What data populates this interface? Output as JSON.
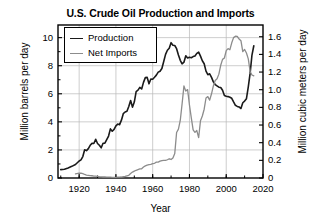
{
  "chart_data": {
    "type": "line",
    "title": "U.S. Crude Oil Production and Imports",
    "xlabel": "Year",
    "ylabel": "Million barrels per day",
    "ylabel_right": "Million cubic meters per day",
    "xlim": [
      1908.5,
      2020
    ],
    "ylim": [
      0,
      10.9
    ],
    "ylim_right": [
      0,
      1.733
    ],
    "grid": true,
    "legend_position": "upper-left",
    "xticks": [
      1920,
      1940,
      1960,
      1980,
      2000,
      2020
    ],
    "xtick_labels": [
      "1920",
      "1940",
      "1960",
      "1980",
      "2000",
      "2020"
    ],
    "yticks": [
      0,
      2,
      4,
      6,
      8,
      10
    ],
    "ytick_labels": [
      "0",
      "2",
      "4",
      "6",
      "8",
      "10"
    ],
    "yticks_right": [
      0,
      0.2,
      0.4,
      0.6,
      0.8,
      1.0,
      1.2,
      1.4,
      1.6
    ],
    "ytick_labels_right": [
      "0",
      "0.2",
      "0.4",
      "0.6",
      "0.8",
      "1.0",
      "1.2",
      "1.4",
      "1.6"
    ],
    "colors": {
      "production": "#1a1a1a",
      "net_imports": "#8c8c8c"
    },
    "series": [
      {
        "name": "Production",
        "color": "#1a1a1a",
        "width": 1.6,
        "x": [
          1910,
          1912,
          1914,
          1916,
          1918,
          1920,
          1921,
          1922,
          1923,
          1924,
          1925,
          1926,
          1927,
          1928,
          1929,
          1930,
          1931,
          1932,
          1933,
          1934,
          1935,
          1936,
          1937,
          1938,
          1939,
          1940,
          1941,
          1942,
          1943,
          1944,
          1945,
          1946,
          1947,
          1948,
          1949,
          1950,
          1951,
          1952,
          1953,
          1954,
          1955,
          1956,
          1957,
          1958,
          1959,
          1960,
          1961,
          1962,
          1963,
          1964,
          1965,
          1966,
          1967,
          1968,
          1969,
          1970,
          1971,
          1972,
          1973,
          1974,
          1975,
          1976,
          1977,
          1978,
          1979,
          1980,
          1981,
          1982,
          1983,
          1984,
          1985,
          1986,
          1987,
          1988,
          1989,
          1990,
          1991,
          1992,
          1993,
          1994,
          1995,
          1996,
          1997,
          1998,
          1999,
          2000,
          2001,
          2002,
          2003,
          2004,
          2005,
          2006,
          2007,
          2008,
          2009,
          2010,
          2011,
          2012,
          2013,
          2014,
          2015
        ],
        "y": [
          0.6,
          0.62,
          0.72,
          0.83,
          0.96,
          1.21,
          1.29,
          1.53,
          2.01,
          1.95,
          2.09,
          2.33,
          2.47,
          2.46,
          2.76,
          2.46,
          2.33,
          2.15,
          2.48,
          2.48,
          2.73,
          2.99,
          3.5,
          3.33,
          3.46,
          3.71,
          3.84,
          3.8,
          4.12,
          4.58,
          4.7,
          4.75,
          5.09,
          5.52,
          5.05,
          5.41,
          6.16,
          6.26,
          6.46,
          6.34,
          6.81,
          7.15,
          7.17,
          6.71,
          7.05,
          7.04,
          7.18,
          7.33,
          7.54,
          7.61,
          7.8,
          8.3,
          8.81,
          9.1,
          9.24,
          9.64,
          9.46,
          9.44,
          9.21,
          8.77,
          8.38,
          8.13,
          8.25,
          8.71,
          8.55,
          8.6,
          8.57,
          8.65,
          8.69,
          8.88,
          8.97,
          8.68,
          8.35,
          8.14,
          7.61,
          7.36,
          7.42,
          7.17,
          6.85,
          6.66,
          6.56,
          6.47,
          6.45,
          6.25,
          5.88,
          5.82,
          5.8,
          5.75,
          5.68,
          5.42,
          5.18,
          5.1,
          5.06,
          4.95,
          5.36,
          5.48,
          5.65,
          6.5,
          7.47,
          8.76,
          9.42
        ]
      },
      {
        "name": "Net Imports",
        "color": "#8c8c8c",
        "width": 1.3,
        "x": [
          1918,
          1920,
          1921,
          1922,
          1923,
          1924,
          1925,
          1926,
          1927,
          1928,
          1929,
          1930,
          1931,
          1932,
          1933,
          1934,
          1935,
          1936,
          1937,
          1938,
          1939,
          1940,
          1941,
          1942,
          1943,
          1944,
          1945,
          1946,
          1947,
          1948,
          1949,
          1950,
          1951,
          1952,
          1953,
          1954,
          1955,
          1956,
          1957,
          1958,
          1959,
          1960,
          1961,
          1962,
          1963,
          1964,
          1965,
          1966,
          1967,
          1968,
          1969,
          1970,
          1971,
          1972,
          1973,
          1974,
          1975,
          1976,
          1977,
          1978,
          1979,
          1980,
          1981,
          1982,
          1983,
          1984,
          1985,
          1986,
          1987,
          1988,
          1989,
          1990,
          1991,
          1992,
          1993,
          1994,
          1995,
          1996,
          1997,
          1998,
          1999,
          2000,
          2001,
          2002,
          2003,
          2004,
          2005,
          2006,
          2007,
          2008,
          2009,
          2010,
          2011,
          2012,
          2013,
          2014,
          2015
        ],
        "y": [
          0.3,
          0.35,
          0.34,
          0.31,
          0.25,
          0.21,
          0.19,
          0.17,
          0.16,
          0.14,
          0.13,
          0.11,
          0.09,
          0.08,
          0.07,
          0.07,
          0.06,
          0.06,
          0.06,
          0.05,
          0.05,
          0.05,
          0.06,
          0.06,
          0.07,
          0.09,
          0.11,
          0.15,
          0.19,
          0.32,
          0.42,
          0.49,
          0.55,
          0.6,
          0.65,
          0.66,
          0.78,
          0.86,
          0.92,
          0.95,
          0.97,
          1.02,
          1.05,
          1.13,
          1.13,
          1.2,
          1.24,
          1.26,
          1.25,
          1.3,
          1.37,
          1.32,
          1.43,
          1.74,
          3.24,
          3.48,
          4.1,
          5.29,
          6.56,
          6.19,
          6.3,
          5.2,
          4.28,
          3.43,
          3.25,
          3.38,
          2.88,
          4.08,
          4.42,
          4.9,
          5.7,
          5.8,
          5.55,
          6.0,
          6.56,
          6.95,
          7.07,
          7.4,
          8.03,
          8.45,
          8.55,
          9.07,
          9.22,
          9.14,
          9.63,
          10.0,
          10.1,
          10.09,
          9.9,
          9.78,
          9.0,
          9.16,
          8.9,
          8.49,
          7.59,
          7.34,
          7.28
        ]
      }
    ]
  },
  "axes": {
    "left_title": "Million barrels per day",
    "right_title": "Million cubic meters per day",
    "x_title": "Year"
  },
  "legend": {
    "items": [
      {
        "label": "Production"
      },
      {
        "label": "Net Imports"
      }
    ]
  }
}
